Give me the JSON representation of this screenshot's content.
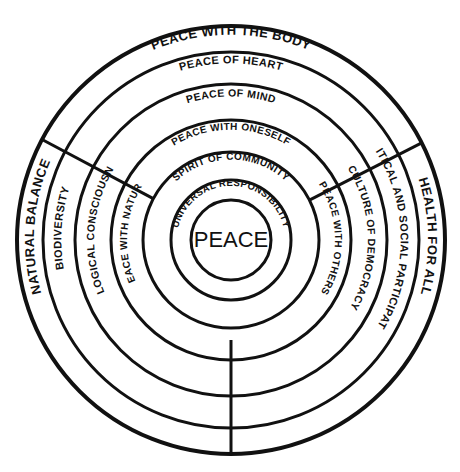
{
  "figure": {
    "type": "concentric-ring-diagram",
    "background_color": "#ffffff",
    "stroke_color": "#111111",
    "center_x": 231,
    "center_y": 240
  },
  "center": {
    "label": "PEACE",
    "radius": 40,
    "font_size": 22
  },
  "rings": [
    {
      "index": 1,
      "inner_radius": 40,
      "outer_radius": 60,
      "stroke_width": 3,
      "top_label": "UNIVERSAL RESPONSIBILITY",
      "left_label": "",
      "right_label": "",
      "label_font_size": 9.5,
      "label_radius": 51
    },
    {
      "index": 2,
      "inner_radius": 60,
      "outer_radius": 88,
      "stroke_width": 3,
      "top_label": "SPIRIT OF COMMUNITY",
      "left_label": "",
      "right_label": "",
      "label_font_size": 10,
      "label_radius": 77
    },
    {
      "index": 3,
      "inner_radius": 88,
      "outer_radius": 120,
      "stroke_width": 3,
      "top_label": "PEACE WITH ONESELF",
      "left_label": "PEACE WITH NATURE",
      "right_label": "PEACE WITH OTHERS",
      "label_font_size": 10,
      "label_radius": 107
    },
    {
      "index": 4,
      "inner_radius": 120,
      "outer_radius": 156,
      "stroke_width": 3,
      "top_label": "PEACE OF MIND",
      "left_label": "ECOLOGICAL CONSCIOUSNESS",
      "right_label": "CULTURE OF DEMOCRACY",
      "label_font_size": 10.5,
      "label_radius": 140
    },
    {
      "index": 5,
      "inner_radius": 156,
      "outer_radius": 188,
      "stroke_width": 3,
      "top_label": "PEACE OF HEART",
      "left_label": "BIODIVERSITY",
      "right_label": "POLITICAL AND SOCIAL PARTICIPATION",
      "label_font_size": 11,
      "label_radius": 173
    },
    {
      "index": 6,
      "inner_radius": 188,
      "outer_radius": 214,
      "stroke_width": 4,
      "top_label": "PEACE WITH THE BODY",
      "left_label": "NATURAL BALANCE",
      "right_label": "HEALTH FOR ALL",
      "label_font_size": 13,
      "label_radius": 201
    }
  ],
  "dividers": [
    {
      "name": "upper-left-divider",
      "angle_deg": 208,
      "from_radius": 88,
      "to_radius": 214
    },
    {
      "name": "upper-right-divider",
      "angle_deg": 333,
      "from_radius": 88,
      "to_radius": 214
    },
    {
      "name": "bottom-divider",
      "angle_deg": 90,
      "from_radius": 100,
      "to_radius": 214
    }
  ],
  "legend": {
    "note": ""
  }
}
